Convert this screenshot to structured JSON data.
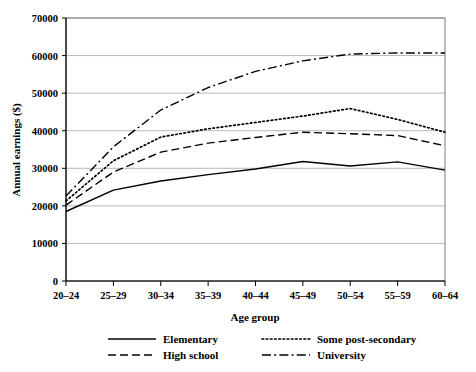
{
  "chart_data": {
    "type": "line",
    "title": "",
    "xlabel": "Age group",
    "ylabel": "Annual earnings ($)",
    "categories": [
      "20–24",
      "25–29",
      "30–34",
      "35–39",
      "40–44",
      "45–49",
      "50–54",
      "55–59",
      "60–64"
    ],
    "ylim": [
      0,
      70000
    ],
    "yticks": [
      0,
      10000,
      20000,
      30000,
      40000,
      50000,
      60000,
      70000
    ],
    "ytick_labels": [
      "0",
      "10000",
      "20000",
      "30000",
      "40000",
      "50000",
      "60000",
      "70000"
    ],
    "grid": true,
    "grid_axis": "y",
    "legend_position": "bottom",
    "series": [
      {
        "name": "Elementary",
        "style": "solid",
        "color": "#000000",
        "values": [
          18500,
          24200,
          26600,
          28300,
          29800,
          31800,
          30600,
          31700,
          29500
        ]
      },
      {
        "name": "High school",
        "style": "dashed",
        "color": "#000000",
        "values": [
          20200,
          29000,
          34300,
          36700,
          38200,
          39600,
          39200,
          38700,
          36000
        ]
      },
      {
        "name": "Some post-secondary",
        "style": "dotted",
        "color": "#000000",
        "values": [
          21300,
          32000,
          38300,
          40500,
          42200,
          43900,
          45900,
          43000,
          39600
        ]
      },
      {
        "name": "University",
        "style": "dashdot",
        "color": "#000000",
        "values": [
          22600,
          35700,
          45500,
          51500,
          55800,
          58600,
          60400,
          60700,
          60700
        ]
      }
    ]
  },
  "legend": {
    "entries": [
      {
        "label": "Elementary",
        "style": "solid"
      },
      {
        "label": "Some post-secondary",
        "style": "dotted"
      },
      {
        "label": "High school",
        "style": "dashed"
      },
      {
        "label": "University",
        "style": "dashdot"
      }
    ]
  }
}
